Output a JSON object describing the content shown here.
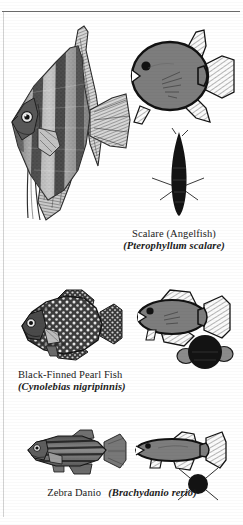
{
  "plate": {
    "background_color": "#ffffff",
    "ink_color": "#1a1a1a",
    "diagram_body_color": "#808080",
    "diagram_outline_color": "#111111",
    "silhouette_color": "#111111",
    "rule_color": "#6d6d6d"
  },
  "entries": [
    {
      "id": "scalare",
      "common_name": "Scalare (Angelfish)",
      "scientific_name": "(Pterophyllum scalare)",
      "caption_layout": "stacked",
      "engraving": "angelfish-engraving",
      "diagram": "angelfish-side-diagram",
      "silhouette": "angelfish-front-silhouette"
    },
    {
      "id": "pearl-fish",
      "common_name": "Black-Finned Pearl Fish",
      "scientific_name": "(Cynolebias nigripinnis)",
      "caption_layout": "stacked",
      "engraving": "pearlfish-engraving",
      "diagram": "pearlfish-side-diagram",
      "silhouette": "pearlfish-front-silhouette"
    },
    {
      "id": "zebra-danio",
      "common_name": "Zebra Danio",
      "scientific_name": "(Brachydanio rerio)",
      "caption_layout": "inline",
      "engraving": "danio-engraving",
      "diagram": "danio-side-diagram",
      "silhouette": "danio-front-silhouette"
    }
  ]
}
